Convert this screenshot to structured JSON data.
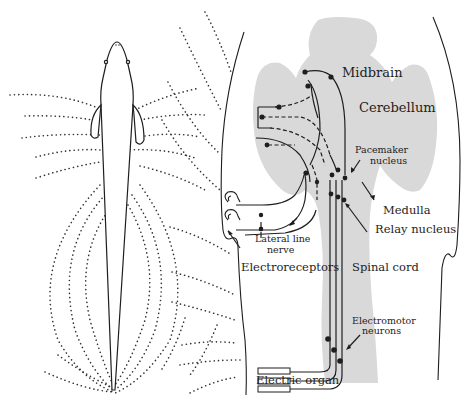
{
  "diagram": {
    "title": "",
    "colors": {
      "ink": "#1e1e1e",
      "brain_fill": "#d9d9d9",
      "field_dots": "#333333",
      "background": "#ffffff"
    },
    "labels": {
      "midbrain": "Midbrain",
      "cerebellum": "Cerebellum",
      "pacemaker_line1": "Pacemaker",
      "pacemaker_line2": "nucleus",
      "medulla": "Medulla",
      "relay_nucleus": "Relay nucleus",
      "lateral_line_line1": "Lateral line",
      "lateral_line_line2": "nerve",
      "electroreceptors": "Electroreceptors",
      "spinal_cord": "Spinal cord",
      "electromotor_line1": "Electromotor",
      "electromotor_line2": "neurons",
      "electric_organ": "Electric organ"
    },
    "panels": [
      {
        "name": "fish-electric-field",
        "description": "Dorsal view of weakly electric fish with dotted electric field lines"
      },
      {
        "name": "neural-circuit",
        "description": "Enlarged body outline with brain, spinal cord, and electrosensory/electromotor pathways"
      }
    ]
  }
}
